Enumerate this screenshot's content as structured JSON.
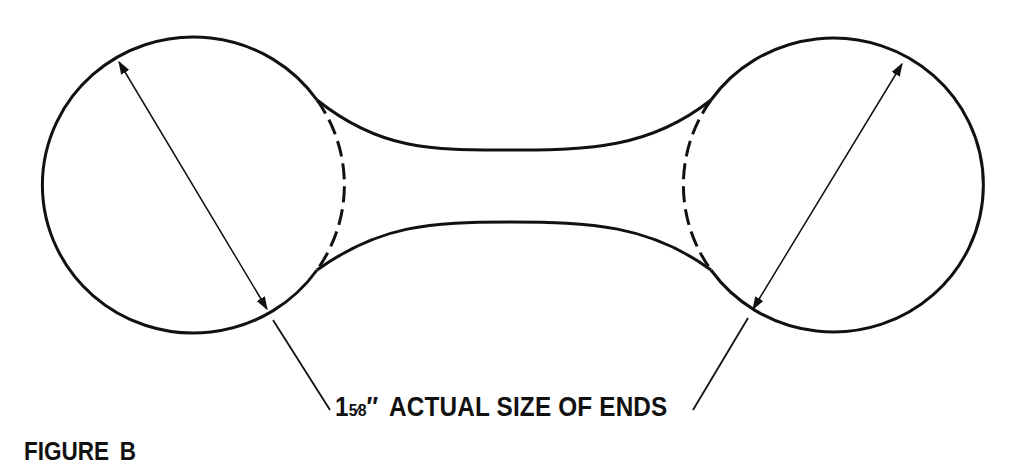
{
  "figure": {
    "caption": "FIGURE B"
  },
  "dimension": {
    "whole": "1",
    "fraction": "5⁄8",
    "unit_mark": "″",
    "text": "ACTUAL SIZE OF ENDS"
  },
  "colors": {
    "stroke": "#111111",
    "background": "#ffffff"
  }
}
